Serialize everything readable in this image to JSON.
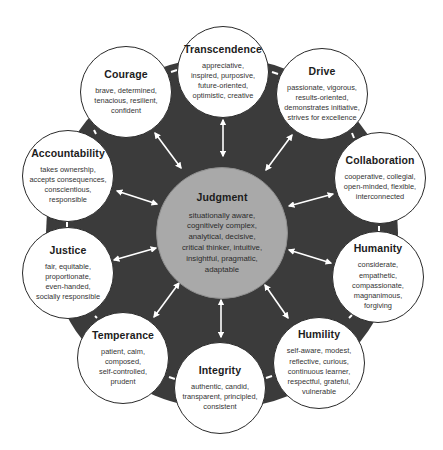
{
  "diagram": {
    "colors": {
      "ring": "#3b3b3b",
      "center_fill": "#a9a9a9",
      "outer_fill": "#ffffff",
      "arrow": "#ffffff"
    },
    "center": {
      "title": "Judgment",
      "description": "situationally aware,\ncognitively complex,\nanalytical, decisive,\ncritical thinker, intuitive,\ninsightful, pragmatic,\nadaptable"
    },
    "nodes": [
      {
        "title": "Transcendence",
        "description": "appreciative,\ninspired, purposive,\nfuture-oriented,\noptimistic, creative"
      },
      {
        "title": "Drive",
        "description": "passionate, vigorous,\nresults-oriented,\ndemonstrates initiative,\nstrives for excellence"
      },
      {
        "title": "Collaboration",
        "description": "cooperative, collegial,\nopen-minded, flexible,\ninterconnected"
      },
      {
        "title": "Humanity",
        "description": "considerate,\nempathetic,\ncompassionate,\nmagnanimous,\nforgiving"
      },
      {
        "title": "Humility",
        "description": "self-aware, modest,\nreflective, curious,\ncontinuous learner,\nrespectful, grateful,\nvulnerable"
      },
      {
        "title": "Integrity",
        "description": "authentic, candid,\ntransparent, principled,\nconsistent"
      },
      {
        "title": "Temperance",
        "description": "patient, calm,\ncomposed,\nself-controlled,\nprudent"
      },
      {
        "title": "Justice",
        "description": "fair, equitable,\nproportionate,\neven-handed,\nsocially responsible"
      },
      {
        "title": "Accountability",
        "description": "takes ownership,\naccepts consequences,\nconscientious,\nresponsible"
      },
      {
        "title": "Courage",
        "description": "brave, determined,\ntenacious, resilient,\nconfident"
      }
    ]
  }
}
